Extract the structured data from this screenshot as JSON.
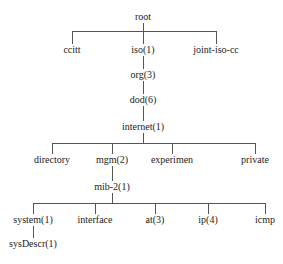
{
  "diagram": {
    "type": "tree",
    "nodes": {
      "root": "root",
      "ccitt": "ccitt",
      "iso": "iso(1)",
      "joint": "joint-iso-cc",
      "org": "org(3)",
      "dod": "dod(6)",
      "internet": "internet(1)",
      "directory": "directory",
      "mgm": "mgm(2)",
      "experimen": "experimen",
      "private": "private",
      "mib2": "mib-2(1)",
      "system": "system(1)",
      "interface": "interface",
      "at": "at(3)",
      "ip": "ip(4)",
      "icmp": "icmp",
      "sysDescr": "sysDescr(1)"
    },
    "edges": [
      [
        "root",
        "ccitt"
      ],
      [
        "root",
        "iso"
      ],
      [
        "root",
        "joint"
      ],
      [
        "iso",
        "org"
      ],
      [
        "org",
        "dod"
      ],
      [
        "dod",
        "internet"
      ],
      [
        "internet",
        "directory"
      ],
      [
        "internet",
        "mgm"
      ],
      [
        "internet",
        "experimen"
      ],
      [
        "internet",
        "private"
      ],
      [
        "mgm",
        "mib2"
      ],
      [
        "mib2",
        "system"
      ],
      [
        "mib2",
        "interface"
      ],
      [
        "mib2",
        "at"
      ],
      [
        "mib2",
        "ip"
      ],
      [
        "mib2",
        "icmp"
      ],
      [
        "system",
        "sysDescr"
      ]
    ]
  }
}
